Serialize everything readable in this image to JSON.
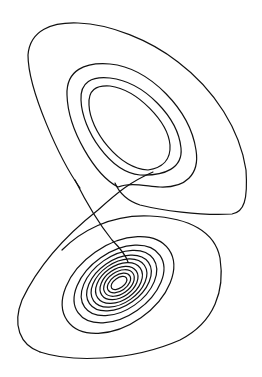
{
  "figure": {
    "stroke_color": "#111111",
    "background_color": "#ffffff",
    "labels": []
  }
}
